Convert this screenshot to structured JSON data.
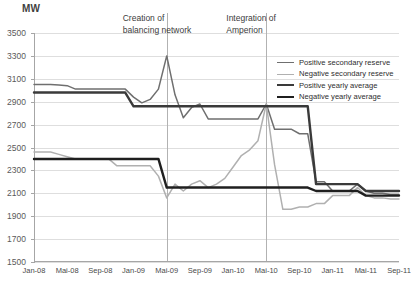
{
  "axis_unit_label": "MW",
  "annotations": [
    {
      "name": "creation-of-balancing-network",
      "text": "Creation of\nbalancing network",
      "x_value": "Mai-09"
    },
    {
      "name": "integration-of-amperion",
      "text": "Integration of\nAmperion",
      "x_value": "Mai-10"
    }
  ],
  "legend": {
    "position": "top-right-inside",
    "items": [
      {
        "label": "Positive secondary reserve",
        "color": "#6f6f6f",
        "width": 1.6
      },
      {
        "label": "Negative secondary reserve",
        "color": "#b0b0b0",
        "width": 1.6
      },
      {
        "label": "Positive yearly average",
        "color": "#3a3a3a",
        "width": 2.6
      },
      {
        "label": "Negative yearly average",
        "color": "#1f1f1f",
        "width": 2.6
      }
    ]
  },
  "chart_data": {
    "type": "line",
    "title": "",
    "xlabel": "",
    "ylabel": "MW",
    "ylim": [
      1500,
      3500
    ],
    "yticks": [
      1500,
      1700,
      1900,
      2100,
      2300,
      2500,
      2700,
      2900,
      3100,
      3300,
      3500
    ],
    "grid": true,
    "x_tick_labels": [
      "Jan-08",
      "Mai-08",
      "Sep-08",
      "Jan-09",
      "Mai-09",
      "Sep-09",
      "Jan-10",
      "Mai-10",
      "Sep-10",
      "Jan-11",
      "Mai-11",
      "Sep-11"
    ],
    "x_tick_indices": [
      0,
      4,
      8,
      12,
      16,
      20,
      24,
      28,
      32,
      36,
      40,
      44
    ],
    "x_months": [
      "Jan-08",
      "Feb-08",
      "Mar-08",
      "Apr-08",
      "Mai-08",
      "Jun-08",
      "Jul-08",
      "Aug-08",
      "Sep-08",
      "Okt-08",
      "Nov-08",
      "Dez-08",
      "Jan-09",
      "Feb-09",
      "Mar-09",
      "Apr-09",
      "Mai-09",
      "Jun-09",
      "Jul-09",
      "Aug-09",
      "Sep-09",
      "Okt-09",
      "Nov-09",
      "Dez-09",
      "Jan-10",
      "Feb-10",
      "Mar-10",
      "Apr-10",
      "Mai-10",
      "Jun-10",
      "Jul-10",
      "Aug-10",
      "Sep-10",
      "Okt-10",
      "Nov-10",
      "Dez-10",
      "Jan-11",
      "Feb-11",
      "Mar-11",
      "Apr-11",
      "Mai-11",
      "Jun-11",
      "Jul-11",
      "Aug-11",
      "Sep-11"
    ],
    "series": [
      {
        "name": "Positive secondary reserve",
        "color": "#6f6f6f",
        "width": 1.5,
        "values": [
          3050,
          3050,
          3050,
          3045,
          3040,
          3010,
          3010,
          3010,
          3010,
          3010,
          3010,
          3010,
          2940,
          2890,
          2920,
          3010,
          3300,
          2960,
          2760,
          2850,
          2880,
          2750,
          2750,
          2750,
          2750,
          2750,
          2750,
          2750,
          2880,
          2660,
          2660,
          2660,
          2620,
          2620,
          2200,
          2200,
          2120,
          2120,
          2120,
          2180,
          2120,
          2100,
          2100,
          2090,
          2090
        ]
      },
      {
        "name": "Negative secondary reserve",
        "color": "#b0b0b0",
        "width": 1.5,
        "values": [
          2460,
          2460,
          2460,
          2440,
          2420,
          2400,
          2400,
          2400,
          2400,
          2400,
          2340,
          2340,
          2340,
          2340,
          2340,
          2250,
          2060,
          2180,
          2120,
          2180,
          2210,
          2150,
          2180,
          2230,
          2330,
          2430,
          2480,
          2560,
          2880,
          2350,
          1960,
          1960,
          1980,
          1980,
          2010,
          2010,
          2080,
          2080,
          2080,
          2150,
          2080,
          2060,
          2060,
          2050,
          2050
        ]
      },
      {
        "name": "Positive yearly average",
        "color": "#3a3a3a",
        "width": 2.4,
        "values": [
          2980,
          2980,
          2980,
          2980,
          2980,
          2980,
          2980,
          2980,
          2980,
          2980,
          2980,
          2980,
          2860,
          2860,
          2860,
          2860,
          2860,
          2860,
          2860,
          2860,
          2860,
          2860,
          2860,
          2860,
          2860,
          2860,
          2860,
          2860,
          2860,
          2860,
          2860,
          2860,
          2860,
          2860,
          2180,
          2180,
          2180,
          2180,
          2180,
          2180,
          2120,
          2120,
          2120,
          2120,
          2120
        ]
      },
      {
        "name": "Negative yearly average",
        "color": "#1f1f1f",
        "width": 2.4,
        "values": [
          2400,
          2400,
          2400,
          2400,
          2400,
          2400,
          2400,
          2400,
          2400,
          2400,
          2400,
          2400,
          2400,
          2400,
          2400,
          2400,
          2150,
          2150,
          2150,
          2150,
          2150,
          2150,
          2150,
          2150,
          2150,
          2150,
          2150,
          2150,
          2150,
          2150,
          2150,
          2150,
          2150,
          2150,
          2120,
          2120,
          2120,
          2120,
          2120,
          2120,
          2080,
          2080,
          2080,
          2080,
          2080
        ]
      }
    ]
  }
}
